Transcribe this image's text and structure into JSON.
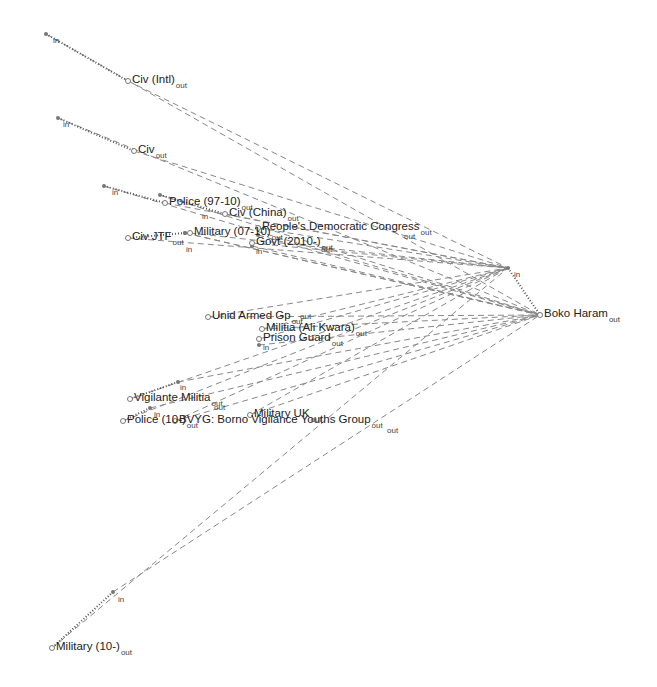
{
  "diagram": {
    "type": "network",
    "colors": {
      "edge": "#888888",
      "self_edge": "#555555",
      "node": "#777777",
      "text": "#222222"
    },
    "nodes": [
      {
        "id": "civ_intl",
        "label": "Civ (Intl)",
        "suffix": "out",
        "x": 128,
        "y": 81,
        "in_x": 46,
        "in_y": 34
      },
      {
        "id": "civ",
        "label": "Civ",
        "suffix": "out",
        "x": 134,
        "y": 151,
        "in_x": 58,
        "in_y": 118
      },
      {
        "id": "police_97_10",
        "label": "Police (97-10)",
        "suffix": "out",
        "x": 165,
        "y": 203,
        "in_x": 104,
        "in_y": 186
      },
      {
        "id": "civ_china",
        "label": "Civ (China)",
        "suffix": "out",
        "x": 225,
        "y": 214,
        "in_x": 160,
        "in_y": 195
      },
      {
        "id": "civ_jtf",
        "label": "Civ JTF",
        "suffix": "out",
        "x": 128,
        "y": 238,
        "in_x": 185,
        "in_y": 233
      },
      {
        "id": "military_07",
        "label": "Military (07-10)",
        "suffix": "out",
        "x": 190,
        "y": 233,
        "in_x": 185,
        "in_y": 233
      },
      {
        "id": "overlap_group",
        "label": "People's Democratic Congress",
        "suffix": "out",
        "x": 258,
        "y": 228,
        "in_x": 258,
        "in_y": 235
      },
      {
        "id": "govt_2010",
        "label": "Govt (2010-)",
        "suffix": "out",
        "x": 252,
        "y": 243,
        "in_x": 252,
        "in_y": 246
      },
      {
        "id": "unid_armed",
        "label": "Unid Armed Gp",
        "suffix": "out",
        "x": 208,
        "y": 317,
        "in_x": 208,
        "in_y": 317
      },
      {
        "id": "militia_ali",
        "label": "Militia (Ali Kwara)",
        "suffix": "out",
        "x": 262,
        "y": 329,
        "in_x": 262,
        "in_y": 329
      },
      {
        "id": "prison_guard",
        "label": "Prison Guard",
        "suffix": "out",
        "x": 259,
        "y": 339,
        "in_x": 259,
        "in_y": 345
      },
      {
        "id": "vigilante",
        "label": "Vigilante Militia",
        "suffix": "out",
        "x": 130,
        "y": 399,
        "in_x": 178,
        "in_y": 382
      },
      {
        "id": "police_1",
        "label": "Police (10-)",
        "suffix": "out",
        "x": 123,
        "y": 421,
        "in_x": 150,
        "in_y": 408
      },
      {
        "id": "bvyg",
        "label": "BVYG: Borno Vigilance Youths Group",
        "suffix": "out",
        "x": 175,
        "y": 421,
        "in_x": 175,
        "in_y": 421
      },
      {
        "id": "military_uk",
        "label": "Military UK",
        "suffix": "out",
        "x": 250,
        "y": 415,
        "in_x": 250,
        "in_y": 415
      },
      {
        "id": "boko_haram",
        "label": "Boko Haram",
        "suffix": "out",
        "x": 540,
        "y": 315,
        "in_x": 508,
        "in_y": 268
      },
      {
        "id": "military_10",
        "label": "Military (10-)",
        "suffix": "out",
        "x": 52,
        "y": 648,
        "in_x": 113,
        "in_y": 592
      }
    ],
    "tags": [
      {
        "text": "in",
        "x": 53,
        "y": 37
      },
      {
        "text": "in",
        "x": 63,
        "y": 121
      },
      {
        "text": "in",
        "x": 112,
        "y": 189
      },
      {
        "text": "in",
        "x": 202,
        "y": 213
      },
      {
        "text": "in",
        "x": 186,
        "y": 246
      },
      {
        "text": "in",
        "x": 256,
        "y": 248
      },
      {
        "text": "out",
        "x": 321,
        "y": 246
      },
      {
        "text": "out",
        "x": 404,
        "y": 233
      },
      {
        "text": "out",
        "x": 300,
        "y": 313
      },
      {
        "text": "in",
        "x": 263,
        "y": 344
      },
      {
        "text": "in",
        "x": 180,
        "y": 384
      },
      {
        "text": "out",
        "x": 214,
        "y": 404
      },
      {
        "text": "in",
        "x": 154,
        "y": 411
      },
      {
        "text": "out",
        "x": 387,
        "y": 427
      },
      {
        "text": "in",
        "x": 514,
        "y": 271
      },
      {
        "text": "in",
        "x": 118,
        "y": 596
      }
    ],
    "target": "boko_haram"
  }
}
